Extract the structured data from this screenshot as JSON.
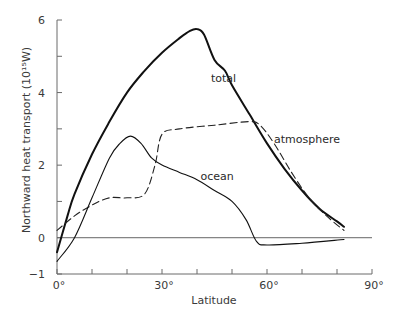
{
  "chart_data": {
    "type": "line",
    "title": "",
    "xlabel": "Latitude",
    "ylabel": "Northward heat transport (10¹⁵W)",
    "xlim": [
      0,
      90
    ],
    "ylim": [
      -1,
      6
    ],
    "x_tick_labels": [
      "0°",
      "30°",
      "60°",
      "90°"
    ],
    "x_tick_values": [
      0,
      30,
      60,
      90
    ],
    "x_minor_ticks": [
      10,
      20,
      40,
      50,
      70,
      80
    ],
    "y_tick_labels": [
      "6",
      "4",
      "2",
      "0",
      "−1"
    ],
    "y_tick_values": [
      6,
      4,
      2,
      0,
      -1
    ],
    "y_minor_ticks": [
      5,
      3,
      1
    ],
    "grid": false,
    "zero_line": true,
    "legend": "inline labels",
    "series": [
      {
        "name": "total",
        "style": "solid-thick",
        "label_pos": [
          44,
          4.3
        ],
        "x": [
          0,
          3,
          5,
          10,
          15,
          20,
          25,
          30,
          35,
          38,
          40,
          42,
          45,
          48,
          50,
          55,
          60,
          65,
          70,
          75,
          80,
          82
        ],
        "values": [
          -0.4,
          0.6,
          1.2,
          2.3,
          3.2,
          4.0,
          4.6,
          5.1,
          5.5,
          5.7,
          5.75,
          5.6,
          4.9,
          4.6,
          4.2,
          3.4,
          2.6,
          1.9,
          1.3,
          0.8,
          0.45,
          0.3
        ]
      },
      {
        "name": "atmosphere",
        "style": "dashed",
        "label_pos": [
          62,
          2.6
        ],
        "x": [
          0,
          5,
          10,
          15,
          20,
          25,
          28,
          30,
          35,
          45,
          55,
          58,
          62,
          67,
          72,
          77,
          82
        ],
        "values": [
          0.2,
          0.6,
          0.9,
          1.1,
          1.1,
          1.2,
          2.0,
          2.85,
          3.0,
          3.1,
          3.2,
          3.1,
          2.6,
          1.8,
          1.1,
          0.6,
          0.2
        ]
      },
      {
        "name": "ocean",
        "style": "solid-thin",
        "label_pos": [
          41,
          1.6
        ],
        "x": [
          0,
          5,
          10,
          15,
          18,
          21,
          24,
          27,
          30,
          35,
          40,
          45,
          50,
          54,
          57,
          60,
          70,
          82
        ],
        "values": [
          -0.65,
          0.0,
          1.1,
          2.2,
          2.6,
          2.8,
          2.6,
          2.2,
          2.0,
          1.8,
          1.6,
          1.3,
          1.0,
          0.5,
          -0.1,
          -0.2,
          -0.15,
          -0.05
        ]
      }
    ]
  }
}
